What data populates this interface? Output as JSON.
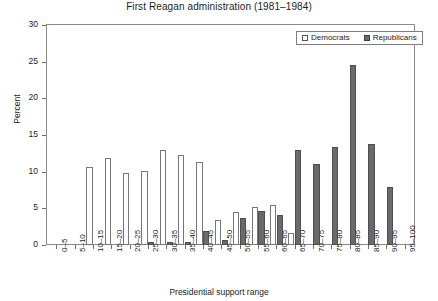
{
  "chart_data": {
    "type": "bar",
    "title": "First Reagan administration (1981–1984)",
    "xlabel": "Presidential support range",
    "ylabel": "Percent",
    "ylim": [
      0,
      30
    ],
    "yticks": [
      0,
      5,
      10,
      15,
      20,
      25,
      30
    ],
    "grid": false,
    "legend_position": "top-right",
    "categories": [
      "0–5",
      "5–10",
      "10–15",
      "15–20",
      "20–25",
      "25–30",
      "30–35",
      "35–40",
      "40–45",
      "45–50",
      "50–55",
      "55–60",
      "60–65",
      "65–70",
      "70–75",
      "75–80",
      "80–85",
      "85–90",
      "90–95",
      "95–100"
    ],
    "series": [
      {
        "name": "Democrats",
        "color": "#ffffff",
        "values": [
          0,
          0,
          10.7,
          11.9,
          9.8,
          10.1,
          12.9,
          12.3,
          11.3,
          3.4,
          4.5,
          5.2,
          5.5,
          1.6,
          0,
          0,
          0,
          0,
          0,
          0
        ]
      },
      {
        "name": "Republicans",
        "color": "#6a6a6a",
        "values": [
          0,
          0,
          0,
          0,
          0,
          0.4,
          0.4,
          0.4,
          1.9,
          0.7,
          3.7,
          4.6,
          4.1,
          12.9,
          11.1,
          13.4,
          24.5,
          13.8,
          7.9,
          0
        ]
      }
    ]
  },
  "legend": {
    "items": [
      {
        "label": "Democrats"
      },
      {
        "label": "Republicans"
      }
    ]
  },
  "colors": {
    "democrat_fill": "#ffffff",
    "republican_fill": "#6a6a6a",
    "axis": "#8a8a8a",
    "text": "#1c1c1c"
  }
}
